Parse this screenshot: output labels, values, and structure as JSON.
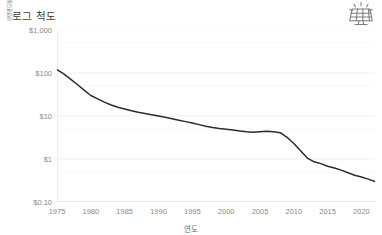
{
  "header": {
    "title": "로그 척도",
    "logo_icon": "solar-panel-icon"
  },
  "colors": {
    "line": "#2b2b2b",
    "grid": "#ededed",
    "axis": "#d9d9d9",
    "tick_text": "#8a8a8a",
    "title_text": "#3d3d3d",
    "axis_title_text": "#6e6e6e"
  },
  "chart_data": {
    "type": "line",
    "title": "로그 척도",
    "xlabel": "연도",
    "ylabel": "태양광 모듈의 비용/와트(2023년 불변 달러)",
    "yscale": "log",
    "ylim": [
      0.1,
      1000
    ],
    "xlim": [
      1975,
      2022
    ],
    "grid": true,
    "legend": "none",
    "y_ticks": [
      {
        "value": 1000,
        "label": "$1,000"
      },
      {
        "value": 100,
        "label": "$100"
      },
      {
        "value": 10,
        "label": "$10"
      },
      {
        "value": 1,
        "label": "$1"
      },
      {
        "value": 0.1,
        "label": "$0.10"
      }
    ],
    "x_ticks": [
      {
        "value": 1975,
        "label": "1975"
      },
      {
        "value": 1980,
        "label": "1980"
      },
      {
        "value": 1985,
        "label": "1985"
      },
      {
        "value": 1990,
        "label": "1990"
      },
      {
        "value": 1995,
        "label": "1995"
      },
      {
        "value": 2000,
        "label": "2000"
      },
      {
        "value": 2005,
        "label": "2005"
      },
      {
        "value": 2010,
        "label": "2010"
      },
      {
        "value": 2015,
        "label": "2015"
      },
      {
        "value": 2020,
        "label": "2020"
      }
    ],
    "series": [
      {
        "name": "태양광 모듈 가격",
        "x": [
          1975,
          1976,
          1977,
          1978,
          1979,
          1980,
          1981,
          1982,
          1983,
          1984,
          1985,
          1986,
          1987,
          1988,
          1989,
          1990,
          1991,
          1992,
          1993,
          1994,
          1995,
          1996,
          1997,
          1998,
          1999,
          2000,
          2001,
          2002,
          2003,
          2004,
          2005,
          2006,
          2007,
          2008,
          2009,
          2010,
          2011,
          2012,
          2013,
          2014,
          2015,
          2016,
          2017,
          2018,
          2019,
          2020,
          2021,
          2022
        ],
        "values": [
          120,
          95,
          72,
          54,
          40,
          30,
          25,
          21,
          18,
          16,
          14.5,
          13.2,
          12.2,
          11.4,
          10.7,
          10.0,
          9.3,
          8.6,
          8.0,
          7.4,
          6.9,
          6.3,
          5.8,
          5.4,
          5.1,
          4.9,
          4.7,
          4.5,
          4.3,
          4.2,
          4.3,
          4.4,
          4.3,
          4.1,
          3.2,
          2.3,
          1.55,
          1.05,
          0.86,
          0.78,
          0.68,
          0.62,
          0.55,
          0.48,
          0.42,
          0.38,
          0.34,
          0.3
        ]
      }
    ]
  }
}
